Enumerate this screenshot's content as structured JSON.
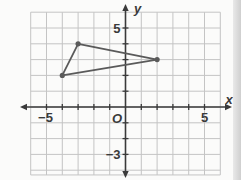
{
  "chart_data": {
    "type": "scatter",
    "title": "",
    "xlabel": "x",
    "ylabel": "y",
    "xlim": [
      -6,
      6
    ],
    "ylim": [
      -4,
      6
    ],
    "grid": true,
    "origin_label": "O",
    "x_tick_labels": [
      {
        "value": -5,
        "label": "−5"
      },
      {
        "value": 5,
        "label": "5"
      }
    ],
    "y_tick_labels": [
      {
        "value": 5,
        "label": "5"
      },
      {
        "value": -3,
        "label": "−3"
      }
    ],
    "shape": "triangle",
    "points": [
      {
        "x": -3,
        "y": 4
      },
      {
        "x": 2,
        "y": 3
      },
      {
        "x": -4,
        "y": 2
      }
    ],
    "colors": {
      "grid": "#c4c4c4",
      "axis": "#3a3a3a",
      "triangle": "#5a5a5a",
      "background": "#fbfbfa"
    }
  }
}
